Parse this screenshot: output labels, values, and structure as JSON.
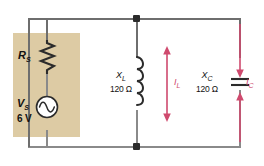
{
  "figure": {
    "type": "circuit-schematic",
    "background_color": "#ffffff",
    "panel_color": "#ddcba4",
    "wire_color": "#8a8a8a",
    "current_color": "#cf4a6e",
    "label_color": "#111111"
  },
  "components": {
    "source": {
      "name": "V_S",
      "symbol": "ac-source",
      "label": "V",
      "label_sub": "S",
      "value": "6 V"
    },
    "resistor": {
      "name": "R_S",
      "symbol": "resistor",
      "label": "R",
      "label_sub": "S",
      "value": ""
    },
    "inductor": {
      "name": "X_L",
      "symbol": "inductor",
      "label": "X",
      "label_sub": "L",
      "value": "120 Ω"
    },
    "capacitor": {
      "name": "X_C",
      "symbol": "capacitor",
      "label": "X",
      "label_sub": "C",
      "value": "120 Ω"
    }
  },
  "currents": {
    "inductor_current": {
      "label": "I",
      "label_sub": "L",
      "arrow_style": "double-headed-outward"
    },
    "capacitor_current": {
      "label": "I",
      "label_sub": "C",
      "arrow_style": "double-headed-inward"
    }
  },
  "nodes": [
    {
      "name": "top-junction"
    },
    {
      "name": "bottom-junction"
    }
  ]
}
